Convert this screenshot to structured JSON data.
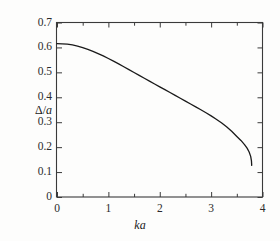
{
  "chart_data": {
    "type": "line",
    "title": "",
    "subtitle": "",
    "xlabel": "ka",
    "ylabel": "Δ/a",
    "xlim": [
      0,
      4
    ],
    "ylim": [
      0,
      0.7
    ],
    "grid": false,
    "legend": null,
    "legend_position": "none",
    "xticks": [
      0,
      1,
      2,
      3,
      4
    ],
    "xtick_labels": [
      "0",
      "1",
      "2",
      "3",
      "4"
    ],
    "xminor_ticks": [
      0.5,
      1.5,
      2.5,
      3.5
    ],
    "yticks": [
      0,
      0.1,
      0.2,
      0.3,
      0.4,
      0.5,
      0.6,
      0.7
    ],
    "ytick_labels": [
      "0",
      "0.1",
      "0.2",
      "0.3",
      "0.4",
      "0.5",
      "0.6",
      "0.7"
    ],
    "axis_box": "full",
    "tick_direction": "in",
    "series": [
      {
        "name": "gap-parameter",
        "color": "#1a1a1a",
        "linewidth": 1.3,
        "x": [
          0.0,
          0.1,
          0.2,
          0.3,
          0.4,
          0.5,
          0.6,
          0.7,
          0.8,
          0.9,
          1.0,
          1.1,
          1.2,
          1.3,
          1.4,
          1.5,
          1.6,
          1.7,
          1.8,
          1.9,
          2.0,
          2.1,
          2.2,
          2.3,
          2.4,
          2.5,
          2.6,
          2.7,
          2.8,
          2.9,
          3.0,
          3.1,
          3.2,
          3.3,
          3.4,
          3.5,
          3.58,
          3.65,
          3.7,
          3.74,
          3.77,
          3.785,
          3.79
        ],
        "y": [
          0.615,
          0.6145,
          0.613,
          0.61,
          0.6055,
          0.5995,
          0.5925,
          0.5845,
          0.5755,
          0.566,
          0.5555,
          0.545,
          0.534,
          0.5225,
          0.511,
          0.4995,
          0.488,
          0.4765,
          0.465,
          0.4535,
          0.442,
          0.4305,
          0.419,
          0.4075,
          0.396,
          0.3845,
          0.373,
          0.3615,
          0.35,
          0.338,
          0.3255,
          0.312,
          0.2975,
          0.2815,
          0.2635,
          0.243,
          0.227,
          0.21,
          0.196,
          0.1805,
          0.163,
          0.145,
          0.127
        ]
      }
    ],
    "annotations": []
  },
  "figure": {
    "background_color": "#fdfdfc",
    "axis_color": "#3a3a3a",
    "text_color": "#2b2b2b"
  }
}
